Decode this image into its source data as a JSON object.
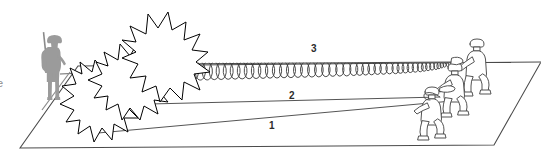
{
  "figure": {
    "type": "technical-diagram",
    "title": "",
    "background_color": "#ffffff",
    "width": 541,
    "height": 164
  },
  "edge_text": {
    "clipped_character": "e"
  },
  "callouts": [
    {
      "id": "1",
      "label": "1",
      "refers_to": "lower-straight-line"
    },
    {
      "id": "2",
      "label": "2",
      "refers_to": "middle-straight-line"
    },
    {
      "id": "3",
      "label": "3",
      "refers_to": "upper-coiled-line"
    }
  ],
  "elements": {
    "ground_plane": {
      "name": "ground-plane",
      "shape": "parallelogram",
      "stroke_color": "#4a4a4a",
      "fill_color": "#ffffff"
    },
    "standing_figure": {
      "name": "standing-soldier-silhouette",
      "fill_color": "#9b9b9b",
      "accessory": "rifle"
    },
    "explosions": {
      "name": "explosion-burst",
      "count": 3,
      "stroke_color": "#000000",
      "fill_color": "#ffffff"
    },
    "kneeling_figures": {
      "name": "kneeling-soldier-group",
      "count": 3,
      "stroke_color": "#4a4a4a",
      "fill_color": "#ffffff"
    },
    "lines": {
      "line_1": {
        "name": "line-1",
        "style": "straight",
        "stroke_color": "#555555"
      },
      "line_2": {
        "name": "line-2",
        "style": "straight",
        "stroke_color": "#555555"
      },
      "line_3": {
        "name": "line-3",
        "style": "coiled-helix",
        "stroke_color": "#3a3a3a"
      }
    }
  },
  "colors": {
    "ink": "#000000",
    "outline": "#4a4a4a",
    "silhouette": "#9b9b9b",
    "line": "#555555",
    "label": "#2b2b2b",
    "paper": "#ffffff"
  }
}
